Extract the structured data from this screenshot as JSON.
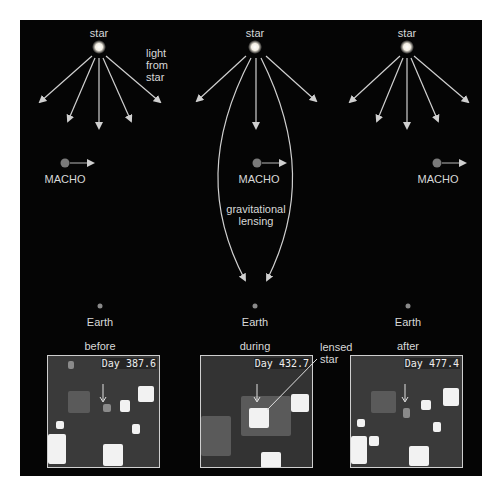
{
  "diagram": {
    "colors": {
      "background": "#050505",
      "page": "#ffffff",
      "arrow": "#d0d0d0",
      "text": "#d8d8d8",
      "macho": "#7a7a7a",
      "frame": "#cfcfcf"
    },
    "columns": [
      {
        "star_label": "star",
        "macho_label": "MACHO",
        "earth_label": "Earth",
        "phase_label": "before",
        "day_label": "Day 387.6"
      },
      {
        "star_label": "star",
        "macho_label": "MACHO",
        "earth_label": "Earth",
        "phase_label": "during",
        "day_label": "Day 432.7"
      },
      {
        "star_label": "star",
        "macho_label": "MACHO",
        "earth_label": "Earth",
        "phase_label": "after",
        "day_label": "Day 477.4"
      }
    ],
    "annotations": {
      "light_from_star": [
        "light",
        "from",
        "star"
      ],
      "gravitational_lensing": [
        "gravitational",
        "lensing"
      ],
      "lensed_star": [
        "lensed",
        "star"
      ]
    }
  }
}
